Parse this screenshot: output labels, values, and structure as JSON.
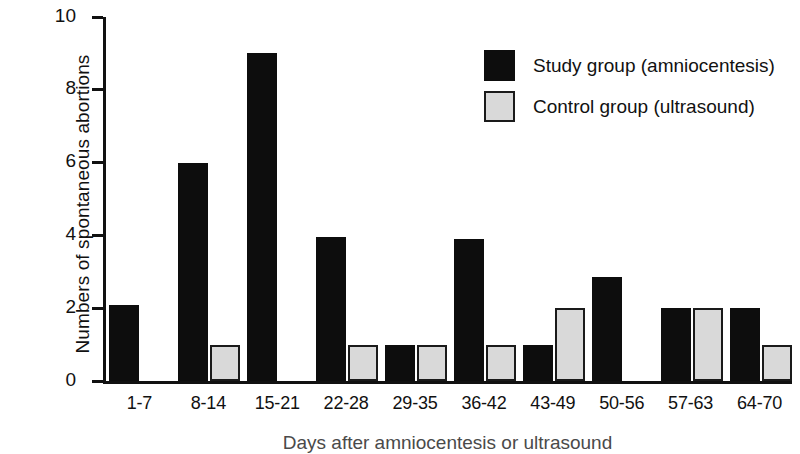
{
  "chart_data": {
    "type": "bar",
    "title": "",
    "subtitle": "",
    "xlabel": "Days after amniocentesis or ultrasound",
    "ylabel": "Numbers of spontaneous abortions",
    "categories": [
      "1-7",
      "8-14",
      "15-21",
      "22-28",
      "29-35",
      "36-42",
      "43-49",
      "50-56",
      "57-63",
      "64-70"
    ],
    "series": [
      {
        "name": "Study group (amniocentesis)",
        "color": "#0d0d0d",
        "values": [
          2.1,
          6,
          9,
          3.95,
          1,
          3.9,
          1,
          2.85,
          2,
          2
        ]
      },
      {
        "name": "Control group (ultrasound)",
        "color": "#d9d9d9",
        "values": [
          null,
          1,
          null,
          1,
          1,
          1,
          2,
          null,
          2,
          1
        ]
      }
    ],
    "ylim": [
      0,
      10
    ],
    "yticks": [
      0,
      2,
      4,
      6,
      8,
      10
    ],
    "yticklabels": [
      "0",
      "2",
      "4",
      "6",
      "8",
      "10"
    ],
    "grid": false,
    "legend_position": "top-right"
  },
  "legend": {
    "items": [
      {
        "label": "Study group (amniocentesis)",
        "swatch": "study"
      },
      {
        "label": "Control group (ultrasound)",
        "swatch": "control"
      }
    ]
  },
  "colors": {
    "study": "#0d0d0d",
    "control": "#d9d9d9",
    "axis": "#111111",
    "background": "#ffffff"
  }
}
